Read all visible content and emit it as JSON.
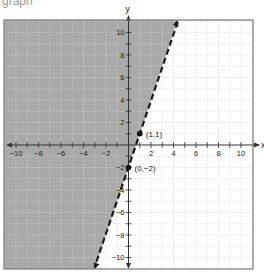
{
  "header_fragment": "graph",
  "chart_data": {
    "type": "inequality-graph",
    "title": "",
    "xlabel": "x",
    "ylabel": "y",
    "xlim": [
      -10,
      10
    ],
    "ylim": [
      -10,
      10
    ],
    "grid": true,
    "x_tick_labels": [
      "-10",
      "-8",
      "-6",
      "-4",
      "-2",
      "2",
      "4",
      "6",
      "8",
      "10"
    ],
    "y_tick_labels": [
      "10",
      "8",
      "6",
      "4",
      "2",
      "-2",
      "-4",
      "-6",
      "-8",
      "-10"
    ],
    "boundary_line": {
      "equation": "y = 3x - 2",
      "slope": 3,
      "intercept": -2,
      "style": "dashed",
      "arrows": "both"
    },
    "shaded_region": "left/above the line (y > 3x - 2)",
    "points": [
      {
        "x": 1,
        "y": 1,
        "label": "(1,1)"
      },
      {
        "x": 0,
        "y": -2,
        "label": "(0,-2)"
      }
    ],
    "colors": {
      "shade": "#a9a9a9",
      "grid": "#d6d6d6",
      "grid_on_shade": "#b8b8b8",
      "axis": "#333333",
      "line": "#1a1a1a",
      "frame": "#777777"
    }
  }
}
